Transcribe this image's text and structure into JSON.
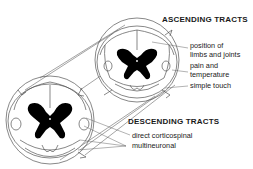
{
  "diagram": {
    "ascending": {
      "title": "ASCENDING TRACTS",
      "items": [
        "position of",
        "limbs and joints",
        "pain and",
        "temperature",
        "simple touch"
      ]
    },
    "descending": {
      "title": "DESCENDING TRACTS",
      "items": [
        "direct corticospinal",
        "multineuronal"
      ]
    },
    "colors": {
      "line": "#555555",
      "grey_matter": "#000000",
      "background": "#ffffff"
    }
  }
}
